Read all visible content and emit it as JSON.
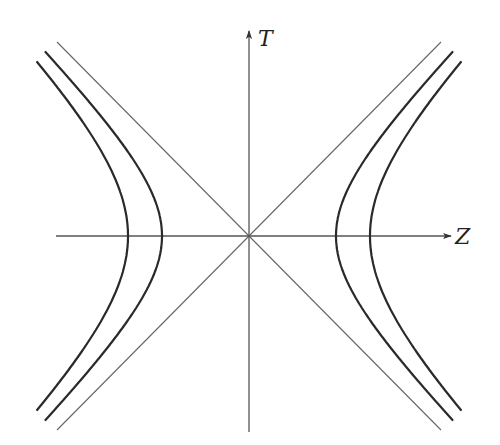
{
  "diagram": {
    "type": "spacetime-hyperbolae",
    "axes": {
      "horizontal": {
        "label": "Z"
      },
      "vertical": {
        "label": "T"
      }
    },
    "origin_px": [
      249,
      236
    ],
    "asymptotes": [
      {
        "name": "light-line-positive",
        "slope": 1
      },
      {
        "name": "light-line-negative",
        "slope": -1
      }
    ],
    "hyperbolae": [
      {
        "name": "inner",
        "a_px": 87
      },
      {
        "name": "outer",
        "a_px": 121
      }
    ],
    "colors": {
      "curve": "#2a2a2a",
      "axis": "#555555",
      "asymptote": "#666666"
    }
  }
}
